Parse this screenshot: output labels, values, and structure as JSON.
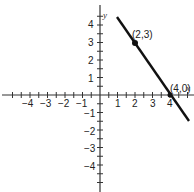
{
  "chart_data": {
    "type": "line",
    "title": "",
    "xlabel": "x",
    "ylabel": "y",
    "xlim": [
      -5,
      5
    ],
    "ylim": [
      -5,
      5
    ],
    "x_ticks": [
      -4,
      -3,
      -2,
      -1,
      1,
      2,
      3,
      4
    ],
    "y_ticks": [
      -4,
      -3,
      -2,
      -1,
      1,
      2,
      3,
      4
    ],
    "grid": false,
    "series": [
      {
        "name": "line",
        "x": [
          1,
          5
        ],
        "y": [
          4.5,
          -1.5
        ],
        "color": "#111111"
      }
    ],
    "points": [
      {
        "x": 2,
        "y": 3,
        "label": "(2,3)"
      },
      {
        "x": 4,
        "y": 0,
        "label": "(4,0)"
      }
    ]
  },
  "labels": {
    "x_axis": "x",
    "y_axis": "y",
    "point1": "(2,3)",
    "point2": "(4,0)",
    "xt": [
      "−4",
      "−3",
      "−2",
      "−1",
      "1",
      "2",
      "3",
      "4"
    ],
    "yt": [
      "4",
      "3",
      "2",
      "1",
      "−1",
      "−2",
      "−3",
      "−4"
    ]
  }
}
